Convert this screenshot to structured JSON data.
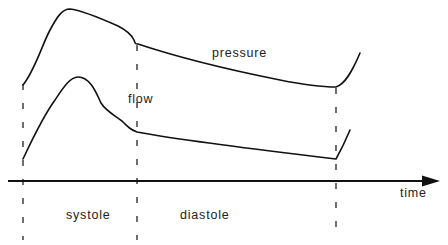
{
  "diagram": {
    "labels": {
      "pressure": "pressure",
      "flow": "flow",
      "time": "time",
      "systole": "systole",
      "diastole": "diastole"
    },
    "curves": [
      {
        "name": "pressure",
        "description": "Arterial pressure waveform over one cardiac cycle: rapid rise in systole, peak, decline with dicrotic notch at end of systole, slow exponential decay in diastole, then rise at next systole"
      },
      {
        "name": "flow",
        "description": "Flow waveform: rapid rise to peak in early systole, fall with notch at end of systole, slow decline through diastole, sharp rise at next beat"
      }
    ],
    "markers": [
      {
        "name": "start-of-systole",
        "x": 23
      },
      {
        "name": "end-of-systole",
        "x": 137
      },
      {
        "name": "end-of-diastole",
        "x": 336
      }
    ],
    "axis": {
      "label": "time",
      "direction": "right"
    },
    "colors": {
      "stroke": "#111111",
      "background": "#ffffff"
    }
  }
}
